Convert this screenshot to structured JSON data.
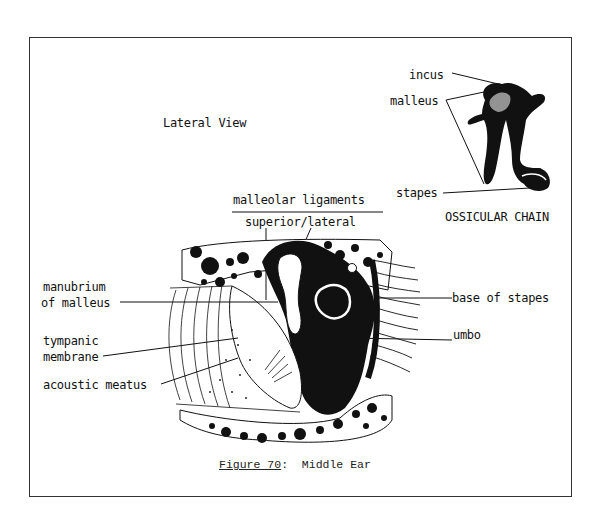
{
  "figure": {
    "caption_prefix": "Figure 70",
    "caption_sep": ":  ",
    "caption_title": "Middle Ear"
  },
  "views": {
    "lateral_view": "Lateral View",
    "ossicular_chain": "OSSICULAR CHAIN"
  },
  "ossicle_labels": {
    "incus": "incus",
    "malleus": "malleus",
    "stapes": "stapes"
  },
  "ligament_labels": {
    "heading": "malleolar ligaments",
    "sub": "superior/lateral"
  },
  "left_labels": {
    "manubrium_line1": "manubrium",
    "manubrium_line2": "of malleus",
    "tympanic_line1": "tympanic",
    "tympanic_line2": "membrane",
    "acoustic": "acoustic meatus"
  },
  "right_labels": {
    "base_of_stapes": "base of stapes",
    "umbo": "umbo"
  }
}
